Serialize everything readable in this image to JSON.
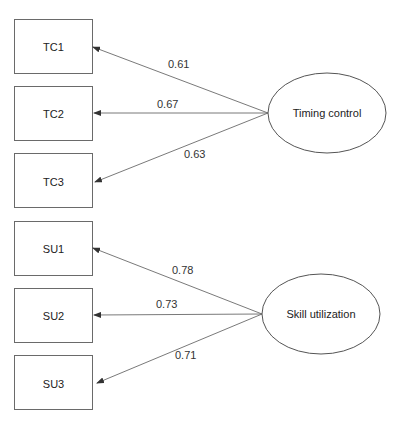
{
  "diagram": {
    "type": "measurement-model",
    "factors": [
      {
        "name": "Timing control",
        "indicators": [
          {
            "name": "TC1",
            "loading": "0.61"
          },
          {
            "name": "TC2",
            "loading": "0.67"
          },
          {
            "name": "TC3",
            "loading": "0.63"
          }
        ]
      },
      {
        "name": "Skill utilization",
        "indicators": [
          {
            "name": "SU1",
            "loading": "0.78"
          },
          {
            "name": "SU2",
            "loading": "0.73"
          },
          {
            "name": "SU3",
            "loading": "0.71"
          }
        ]
      }
    ]
  },
  "colors": {
    "stroke": "#6a6a6a",
    "text": "#333333",
    "background": "#ffffff"
  }
}
